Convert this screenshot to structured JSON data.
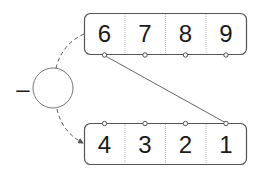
{
  "diagram": {
    "operator": "–",
    "top_row": {
      "cells": [
        "6",
        "7",
        "8",
        "9"
      ]
    },
    "bottom_row": {
      "cells": [
        "4",
        "3",
        "2",
        "1"
      ]
    },
    "connections": [
      {
        "from": "top_row.cells.0",
        "to": "bottom_row.cells.3",
        "style": "solid"
      }
    ],
    "flow": {
      "from": "top_row",
      "via": "circle",
      "to": "bottom_row",
      "style": "dashed-arrow"
    },
    "colors": {
      "stroke": "#555555",
      "dashed": "#555555",
      "cell_divider": "#999999",
      "text": "#1a1a1a"
    }
  }
}
